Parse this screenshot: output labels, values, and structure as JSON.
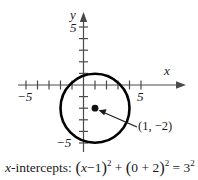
{
  "figure": {
    "type": "coordinate-plane-circle-graph",
    "axes": {
      "x_axis_name": "x",
      "y_axis_name": "y",
      "x_tick_label_left": "−5",
      "x_tick_label_right": "5",
      "y_tick_label_top": "5",
      "y_tick_label_bottom": "−5",
      "x_range": [
        -6,
        6
      ],
      "y_range": [
        -6,
        6
      ],
      "tick_interval": 1,
      "labeled_ticks": [
        -5,
        5
      ],
      "grid": false
    },
    "circle": {
      "center_label": "(1, −2)",
      "center_x": 1,
      "center_y": -2,
      "radius": 3
    },
    "annotation": {
      "point_label": "(1, −2)",
      "arrow": "points-to-center"
    },
    "caption": {
      "prefix_italic": "x",
      "prefix_rest": "-intercepts:",
      "term1_open": "(",
      "term1_var": "x",
      "term1_rest": "−1",
      "term1_close": ")",
      "term1_exp": "2",
      "plus": "+",
      "term2_open": "(",
      "term2_rest": "0 + 2",
      "term2_close": ")",
      "term2_exp": "2",
      "equals": "=",
      "rhs_base": "3",
      "rhs_exp": "2",
      "full_text": "x-intercepts: (x − 1)² + (0 + 2)² = 3²"
    },
    "colors": {
      "ink": "#1a1a1a",
      "axis": "#4a4a4a",
      "curve": "#000000",
      "background": "#ffffff"
    }
  }
}
